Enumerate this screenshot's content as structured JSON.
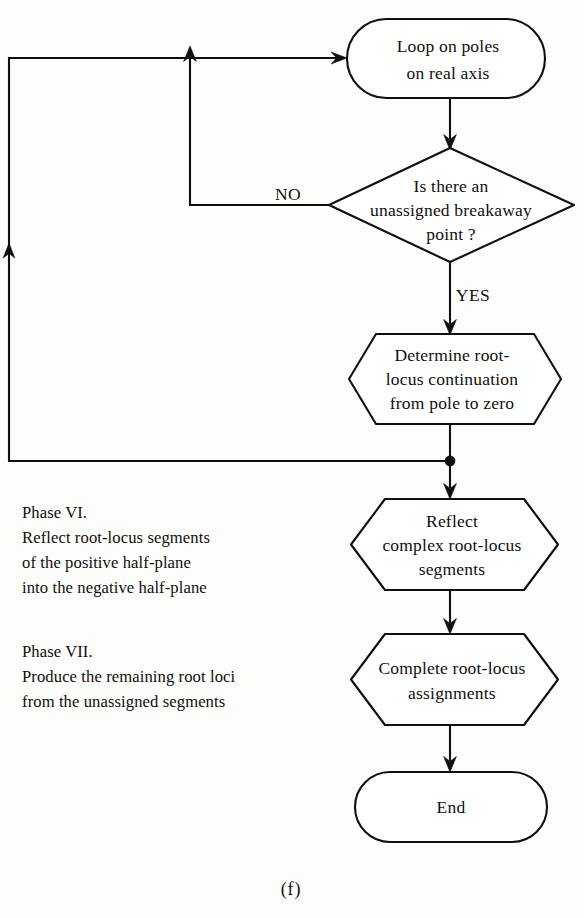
{
  "figure": {
    "caption": "(f)",
    "type": "flowchart",
    "title_note": "Root-locus construction procedure, final phases"
  },
  "nodes": {
    "start_loop": {
      "shape": "terminator",
      "lines": [
        "Loop on poles",
        "on  real axis"
      ]
    },
    "decision_breakaway": {
      "shape": "decision",
      "lines": [
        "Is there an",
        "unassigned breakaway",
        "point ?"
      ]
    },
    "determine_continuation": {
      "shape": "hexagon",
      "lines": [
        "Determine root-",
        "locus continuation",
        "from pole to zero"
      ]
    },
    "reflect_segments": {
      "shape": "hexagon",
      "lines": [
        "Reflect",
        "complex root-locus",
        "segments"
      ]
    },
    "complete_assignments": {
      "shape": "hexagon",
      "lines": [
        "Complete root-locus",
        "assignments"
      ]
    },
    "end": {
      "shape": "terminator",
      "lines": [
        "End"
      ]
    }
  },
  "branch_labels": {
    "no": "NO",
    "yes": "YES"
  },
  "annotations": {
    "phase_vi": {
      "heading": "Phase VI.",
      "lines": [
        "Reflect root-locus segments",
        "of the positive half-plane",
        "into the negative half-plane"
      ]
    },
    "phase_vii": {
      "heading": "Phase VII.",
      "lines": [
        "Produce the remaining root loci",
        "from the unassigned segments"
      ]
    }
  },
  "colors": {
    "ink": "#100f0d",
    "paper": "#fdfdfc",
    "shape_fill": "#ffffff"
  }
}
